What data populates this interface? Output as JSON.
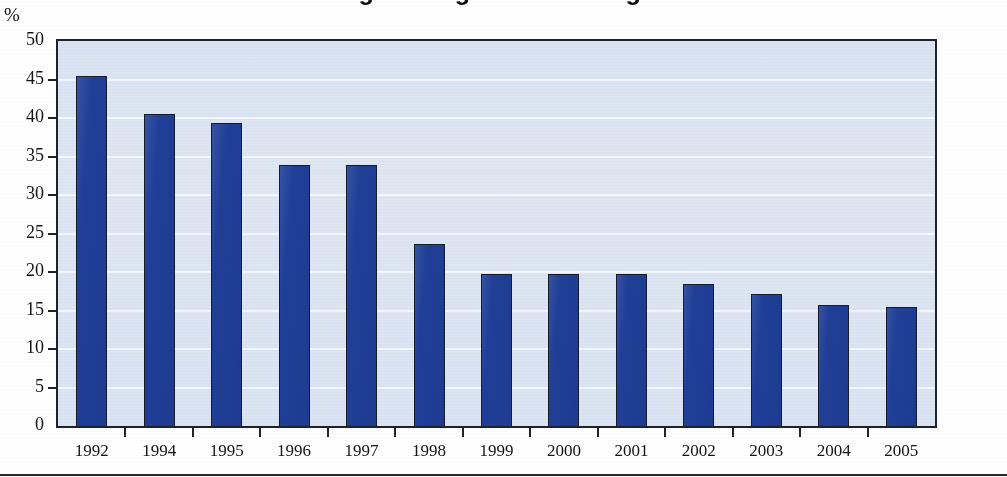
{
  "figure": {
    "title_clipped": "Anteil der Bevölkerung mit Migrationshintergrund in Prozent",
    "unit_label": "%",
    "background_color": "#dfe6f2",
    "bar_color": "#1f3f98",
    "bar_border_color": "#161b2e",
    "gridline_color": "#f4f8fd",
    "frame_color": "#20222b"
  },
  "showthrough_lines": [
    "eine Gruppe von Staaten kommen, die den Rat bilden",
    "damit erlebte die Union die vollständige Integration",
    "der östlichen Teil",
    "und die Beteiligung der Staaten an den Verfahren",
    "in einer dauerhaften Weise zu verbessern und zu stabilisieren",
    "zugunsten der entsprechenden Regionen",
    "die Kommission der Europäischen Gemeinschaften"
  ],
  "chart_data": {
    "type": "bar",
    "title": "",
    "xlabel": "",
    "ylabel": "%",
    "ylim": [
      0,
      50
    ],
    "ytick_step": 5,
    "yticks": [
      0,
      5,
      10,
      15,
      20,
      25,
      30,
      35,
      40,
      45,
      50
    ],
    "grid": true,
    "legend": "none",
    "categories": [
      "1992",
      "1994",
      "1995",
      "1996",
      "1997",
      "1998",
      "1999",
      "2000",
      "2001",
      "2002",
      "2003",
      "2004",
      "2005"
    ],
    "values": [
      45.4,
      40.5,
      39.4,
      33.9,
      33.9,
      23.6,
      19.8,
      19.7,
      19.8,
      18.4,
      17.2,
      15.7,
      15.4
    ],
    "series": [
      {
        "name": "Anteil in Prozent",
        "color": "#1f3f98",
        "values": [
          45.4,
          40.5,
          39.4,
          33.9,
          33.9,
          23.6,
          19.8,
          19.7,
          19.8,
          18.4,
          17.2,
          15.7,
          15.4
        ]
      }
    ]
  }
}
